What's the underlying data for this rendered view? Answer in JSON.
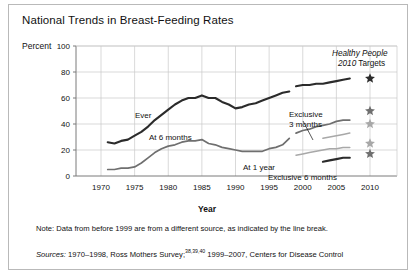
{
  "figure": {
    "title": "National Trends in Breast-Feeding Rates",
    "y_axis_unit": "Percent",
    "x_axis_title": "Year",
    "note": "Note: Data from before 1999 are from a different source, as indicated by the line break.",
    "sources_prefix": "Sources:",
    "sources_text": " 1970–1998, Ross Mothers Survey;",
    "sources_refs": "38,39,40",
    "sources_text2": " 1999–2007, Centers for Disease Control",
    "target_header_line1_italic": "Healthy People",
    "target_header_line2_italic": "2010",
    "target_header_line2_plain": " Targets"
  },
  "colors": {
    "dark": "#2b2b2b",
    "mid": "#6f6f6f",
    "light": "#a8a8a8",
    "grid": "#c9c9c9",
    "axis": "#7a7a7a",
    "frame": "#b9b9b9",
    "text": "#111111"
  },
  "chart_data": {
    "type": "line",
    "title": "National Trends in Breast-Feeding Rates",
    "xlabel": "Year",
    "ylabel": "Percent",
    "xlim": [
      1970,
      2010
    ],
    "ylim": [
      0,
      100
    ],
    "yticks": [
      0,
      20,
      40,
      60,
      80,
      100
    ],
    "xticks": [
      1970,
      1975,
      1980,
      1985,
      1990,
      1995,
      2000,
      2005,
      2010
    ],
    "grid": true,
    "legend": "inline-labels",
    "series": [
      {
        "name": "Ever",
        "label": "Ever",
        "color": "dark",
        "segment": "pre-1999",
        "x": [
          1971,
          1972,
          1973,
          1974,
          1975,
          1976,
          1977,
          1978,
          1979,
          1980,
          1981,
          1982,
          1983,
          1984,
          1985,
          1986,
          1987,
          1988,
          1989,
          1990,
          1991,
          1992,
          1993,
          1994,
          1995,
          1996,
          1997,
          1998
        ],
        "y": [
          26,
          25,
          27,
          28,
          31,
          34,
          38,
          43,
          47,
          51,
          55,
          58,
          60,
          60,
          62,
          60,
          60,
          57,
          55,
          52,
          53,
          55,
          56,
          58,
          60,
          62,
          64,
          65
        ]
      },
      {
        "name": "Ever",
        "label": "",
        "color": "dark",
        "segment": "post-1999",
        "x": [
          1999,
          2000,
          2001,
          2002,
          2003,
          2004,
          2005,
          2006,
          2007
        ],
        "y": [
          69,
          70,
          70,
          71,
          71,
          72,
          73,
          74,
          75
        ]
      },
      {
        "name": "At 6 months",
        "label": "At 6 months",
        "color": "mid",
        "segment": "pre-1999",
        "x": [
          1971,
          1972,
          1973,
          1974,
          1975,
          1976,
          1977,
          1978,
          1979,
          1980,
          1981,
          1982,
          1983,
          1984,
          1985,
          1986,
          1987,
          1988,
          1989,
          1990,
          1991,
          1992,
          1993,
          1994,
          1995,
          1996,
          1997,
          1998
        ],
        "y": [
          5,
          5,
          6,
          6,
          7,
          10,
          14,
          18,
          21,
          23,
          24,
          26,
          27,
          27,
          28,
          25,
          24,
          22,
          21,
          20,
          19,
          19,
          19,
          19,
          21,
          22,
          24,
          29
        ]
      },
      {
        "name": "At 6 months",
        "label": "",
        "color": "mid",
        "segment": "post-1999",
        "x": [
          1999,
          2000,
          2001,
          2002,
          2003,
          2004,
          2005,
          2006,
          2007
        ],
        "y": [
          33,
          35,
          36,
          38,
          39,
          40,
          42,
          43,
          43
        ]
      },
      {
        "name": "At 1 year",
        "label": "At 1 year",
        "color": "light",
        "segment": "post-1999",
        "x": [
          1999,
          2000,
          2001,
          2002,
          2003,
          2004,
          2005,
          2006,
          2007
        ],
        "y": [
          16,
          17,
          18,
          19,
          20,
          21,
          21,
          22,
          22
        ]
      },
      {
        "name": "Exclusive 3 months",
        "label": "Exclusive 3 months",
        "color": "light",
        "segment": "post-1999",
        "x": [
          2003,
          2004,
          2005,
          2006,
          2007
        ],
        "y": [
          29,
          30,
          31,
          32,
          33
        ]
      },
      {
        "name": "Exclusive 6 months",
        "label": "Exclusive 6 months",
        "color": "dark",
        "segment": "post-1999",
        "x": [
          2003,
          2004,
          2005,
          2006,
          2007
        ],
        "y": [
          11,
          12,
          13,
          14,
          14
        ]
      }
    ],
    "targets": [
      {
        "name": "Ever",
        "year": 2010,
        "value": 75,
        "shade": "dark"
      },
      {
        "name": "At 6 months",
        "year": 2010,
        "value": 50,
        "shade": "mid"
      },
      {
        "name": "Exclusive 3 months",
        "year": 2010,
        "value": 40,
        "shade": "light"
      },
      {
        "name": "At 1 year",
        "year": 2010,
        "value": 25,
        "shade": "light"
      },
      {
        "name": "Exclusive 6 months",
        "year": 2010,
        "value": 17,
        "shade": "mid"
      }
    ]
  }
}
